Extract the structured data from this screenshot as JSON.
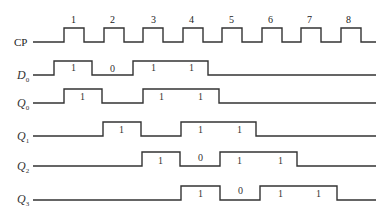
{
  "diagram": {
    "stroke_color": "#333333",
    "clock": {
      "label": "CP",
      "pulse_numbers": [
        "1",
        "2",
        "3",
        "4",
        "5",
        "6",
        "7",
        "8"
      ]
    },
    "signals": [
      {
        "name": "D0",
        "label_main": "D",
        "label_sub": "0",
        "value_labels": [
          "1",
          "0",
          "1",
          "1"
        ]
      },
      {
        "name": "Q0",
        "label_main": "Q",
        "label_sub": "0",
        "value_labels": [
          "1",
          "1",
          "1"
        ]
      },
      {
        "name": "Q1",
        "label_main": "Q",
        "label_sub": "1",
        "value_labels": [
          "1",
          "1",
          "1"
        ]
      },
      {
        "name": "Q2",
        "label_main": "Q",
        "label_sub": "2",
        "value_labels": [
          "1",
          "0",
          "1",
          "1"
        ]
      },
      {
        "name": "Q3",
        "label_main": "Q",
        "label_sub": "3",
        "value_labels": [
          "1",
          "0",
          "1",
          "1"
        ]
      }
    ]
  }
}
